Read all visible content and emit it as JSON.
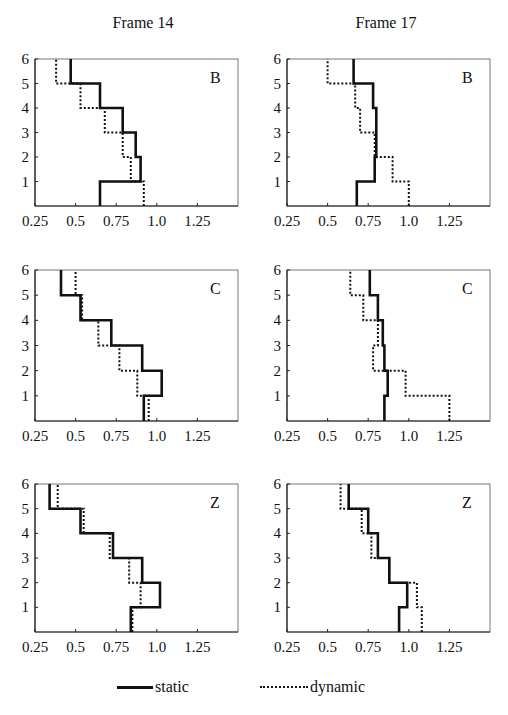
{
  "columns": [
    {
      "title": "Frame 14"
    },
    {
      "title": "Frame 17"
    }
  ],
  "legend": {
    "static_label": "static",
    "dynamic_label": "dynamic"
  },
  "chart_data": [
    {
      "type": "line",
      "subtype": "step-profile",
      "panel": "B",
      "column": "Frame 14",
      "ylabel_ticks": [
        1,
        2,
        3,
        4,
        5,
        6
      ],
      "ylim": [
        0,
        6
      ],
      "xticks": [
        "0.25",
        "0.5",
        "0.75",
        "1.0",
        "1.25"
      ],
      "xlim": [
        0.25,
        1.5
      ],
      "levels": [
        "0-1",
        "1-2",
        "2-3",
        "3-4",
        "4-5",
        "5-6"
      ],
      "series": [
        {
          "name": "static",
          "style": "solid",
          "values": [
            0.65,
            0.9,
            0.87,
            0.79,
            0.65,
            0.47
          ]
        },
        {
          "name": "dynamic",
          "style": "dotted",
          "values": [
            0.92,
            0.84,
            0.79,
            0.68,
            0.53,
            0.38
          ]
        }
      ]
    },
    {
      "type": "line",
      "subtype": "step-profile",
      "panel": "B",
      "column": "Frame 17",
      "ylabel_ticks": [
        1,
        2,
        3,
        4,
        5,
        6
      ],
      "ylim": [
        0,
        6
      ],
      "xticks": [
        "0.25",
        "0.5",
        "0.75",
        "1.0",
        "1.25"
      ],
      "xlim": [
        0.25,
        1.5
      ],
      "levels": [
        "0-1",
        "1-2",
        "2-3",
        "3-4",
        "4-5",
        "5-6"
      ],
      "series": [
        {
          "name": "static",
          "style": "solid",
          "values": [
            0.68,
            0.79,
            0.8,
            0.8,
            0.78,
            0.66
          ]
        },
        {
          "name": "dynamic",
          "style": "dotted",
          "values": [
            1.0,
            0.9,
            0.79,
            0.7,
            0.67,
            0.5
          ]
        }
      ]
    },
    {
      "type": "line",
      "subtype": "step-profile",
      "panel": "C",
      "column": "Frame 14",
      "ylabel_ticks": [
        1,
        2,
        3,
        4,
        5,
        6
      ],
      "ylim": [
        0,
        6
      ],
      "xticks": [
        "0.25",
        "0.5",
        "0.75",
        "1.0",
        "1.25"
      ],
      "xlim": [
        0.25,
        1.5
      ],
      "levels": [
        "0-1",
        "1-2",
        "2-3",
        "3-4",
        "4-5",
        "5-6"
      ],
      "series": [
        {
          "name": "static",
          "style": "solid",
          "values": [
            0.92,
            1.03,
            0.91,
            0.72,
            0.53,
            0.41
          ]
        },
        {
          "name": "dynamic",
          "style": "dotted",
          "values": [
            0.95,
            0.88,
            0.77,
            0.64,
            0.54,
            0.5
          ]
        }
      ]
    },
    {
      "type": "line",
      "subtype": "step-profile",
      "panel": "C",
      "column": "Frame 17",
      "ylabel_ticks": [
        1,
        2,
        3,
        4,
        5,
        6
      ],
      "ylim": [
        0,
        6
      ],
      "xticks": [
        "0.25",
        "0.5",
        "0.75",
        "1.0",
        "1.25"
      ],
      "xlim": [
        0.25,
        1.5
      ],
      "levels": [
        "0-1",
        "1-2",
        "2-3",
        "3-4",
        "4-5",
        "5-6"
      ],
      "series": [
        {
          "name": "static",
          "style": "solid",
          "values": [
            0.85,
            0.87,
            0.85,
            0.84,
            0.81,
            0.76
          ]
        },
        {
          "name": "dynamic",
          "style": "dotted",
          "values": [
            1.25,
            0.98,
            0.78,
            0.81,
            0.72,
            0.64
          ]
        }
      ]
    },
    {
      "type": "line",
      "subtype": "step-profile",
      "panel": "Z",
      "column": "Frame 14",
      "ylabel_ticks": [
        1,
        2,
        3,
        4,
        5,
        6
      ],
      "ylim": [
        0,
        6
      ],
      "xticks": [
        "0.25",
        "0.5",
        "0.75",
        "1.0",
        "1.25"
      ],
      "xlim": [
        0.25,
        1.5
      ],
      "levels": [
        "0-1",
        "1-2",
        "2-3",
        "3-4",
        "4-5",
        "5-6"
      ],
      "series": [
        {
          "name": "static",
          "style": "solid",
          "values": [
            0.84,
            1.02,
            0.91,
            0.73,
            0.53,
            0.34
          ]
        },
        {
          "name": "dynamic",
          "style": "dotted",
          "values": [
            0.85,
            0.9,
            0.83,
            0.71,
            0.55,
            0.39
          ]
        }
      ]
    },
    {
      "type": "line",
      "subtype": "step-profile",
      "panel": "Z",
      "column": "Frame 17",
      "ylabel_ticks": [
        1,
        2,
        3,
        4,
        5,
        6
      ],
      "ylim": [
        0,
        6
      ],
      "xticks": [
        "0.25",
        "0.5",
        "0.75",
        "1.0",
        "1.25"
      ],
      "xlim": [
        0.25,
        1.5
      ],
      "levels": [
        "0-1",
        "1-2",
        "2-3",
        "3-4",
        "4-5",
        "5-6"
      ],
      "series": [
        {
          "name": "static",
          "style": "solid",
          "values": [
            0.94,
            0.99,
            0.88,
            0.81,
            0.75,
            0.63
          ]
        },
        {
          "name": "dynamic",
          "style": "dotted",
          "values": [
            1.08,
            1.05,
            0.88,
            0.77,
            0.71,
            0.58
          ]
        }
      ]
    }
  ]
}
